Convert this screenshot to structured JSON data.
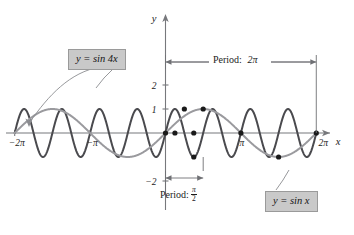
{
  "figure": {
    "background": "#ffffff",
    "width": 354,
    "height": 235
  },
  "axes": {
    "x_axis_label": "x",
    "y_axis_label": "y",
    "x_tick_labels": [
      "−2π",
      "−π",
      "π",
      "2π"
    ],
    "x_tick_values": [
      -6.283185,
      -3.141593,
      3.141593,
      6.283185
    ],
    "y_tick_labels": [
      "2",
      "1",
      "−2"
    ],
    "y_tick_values": [
      2,
      1,
      -2
    ],
    "axis_color": "#77787c",
    "xlim": [
      -7.4,
      7.6
    ],
    "ylim": [
      -2.45,
      2.6
    ],
    "grid": false
  },
  "callouts": {
    "sin4x": {
      "text": "y = sin 4x",
      "fill": "#c9c9c9",
      "border": "#9a9a9a"
    },
    "sinx": {
      "text": "y = sin x",
      "fill": "#c9c9c9",
      "border": "#9a9a9a"
    }
  },
  "annotations": {
    "period_2pi": {
      "text": "Period:",
      "value": "2π",
      "from_x": 0,
      "to_x": 6.283185
    },
    "period_half_pi": {
      "text": "Period:",
      "numerator": "π",
      "denominator": "2",
      "from_x": 0,
      "to_x": 1.570796
    }
  },
  "chart_data": {
    "type": "line",
    "title": "",
    "subtitle": "",
    "xlabel": "x",
    "ylabel": "y",
    "xlim": [
      -7.4,
      7.6
    ],
    "ylim": [
      -2.45,
      2.6
    ],
    "grid": false,
    "legend_position": "callout-boxes",
    "x_tick_labels": [
      "−2π",
      "−π",
      "π",
      "2π"
    ],
    "x_ticks": [
      -6.283185,
      -3.141593,
      3.141593,
      6.283185
    ],
    "y_tick_labels": [
      "2",
      "1",
      "−2"
    ],
    "y_ticks": [
      2,
      1,
      -2
    ],
    "series": [
      {
        "name": "y = sin 4x",
        "expression": "sin(4x)",
        "amplitude": 1,
        "period": 1.570796,
        "period_label": "π/2",
        "frequency": 4,
        "color": "#4a4a4e",
        "width": 2.0,
        "x_start": -6.283185,
        "x_end": 6.283185
      },
      {
        "name": "y = sin x",
        "expression": "sin(x)",
        "amplitude": 1,
        "period": 6.283185,
        "period_label": "2π",
        "frequency": 1,
        "color": "#9a9a9e",
        "width": 2.0,
        "x_start": -6.283185,
        "x_end": 6.283185
      }
    ],
    "marked_points": [
      {
        "x": 0,
        "y": 0,
        "label": "(0, 0)"
      },
      {
        "x": 1.570796,
        "y": 1,
        "label": "(π/2, 1)"
      },
      {
        "x": 3.141593,
        "y": 0,
        "label": "(π, 0)"
      },
      {
        "x": 4.712389,
        "y": -1,
        "label": "(3π/2, −1)"
      },
      {
        "x": 6.283185,
        "y": 0,
        "label": "(2π, 0)"
      },
      {
        "x": 0.785398,
        "y": 1,
        "label": "(π/4, 1)"
      },
      {
        "x": 1.178097,
        "y": 0,
        "label": "(3π/8, 0)"
      },
      {
        "x": 0.392699,
        "y": 0,
        "label": "(π/8, 0)"
      },
      {
        "x": 1.178097,
        "y": -1,
        "label": "(5π/8, −1)"
      }
    ]
  }
}
